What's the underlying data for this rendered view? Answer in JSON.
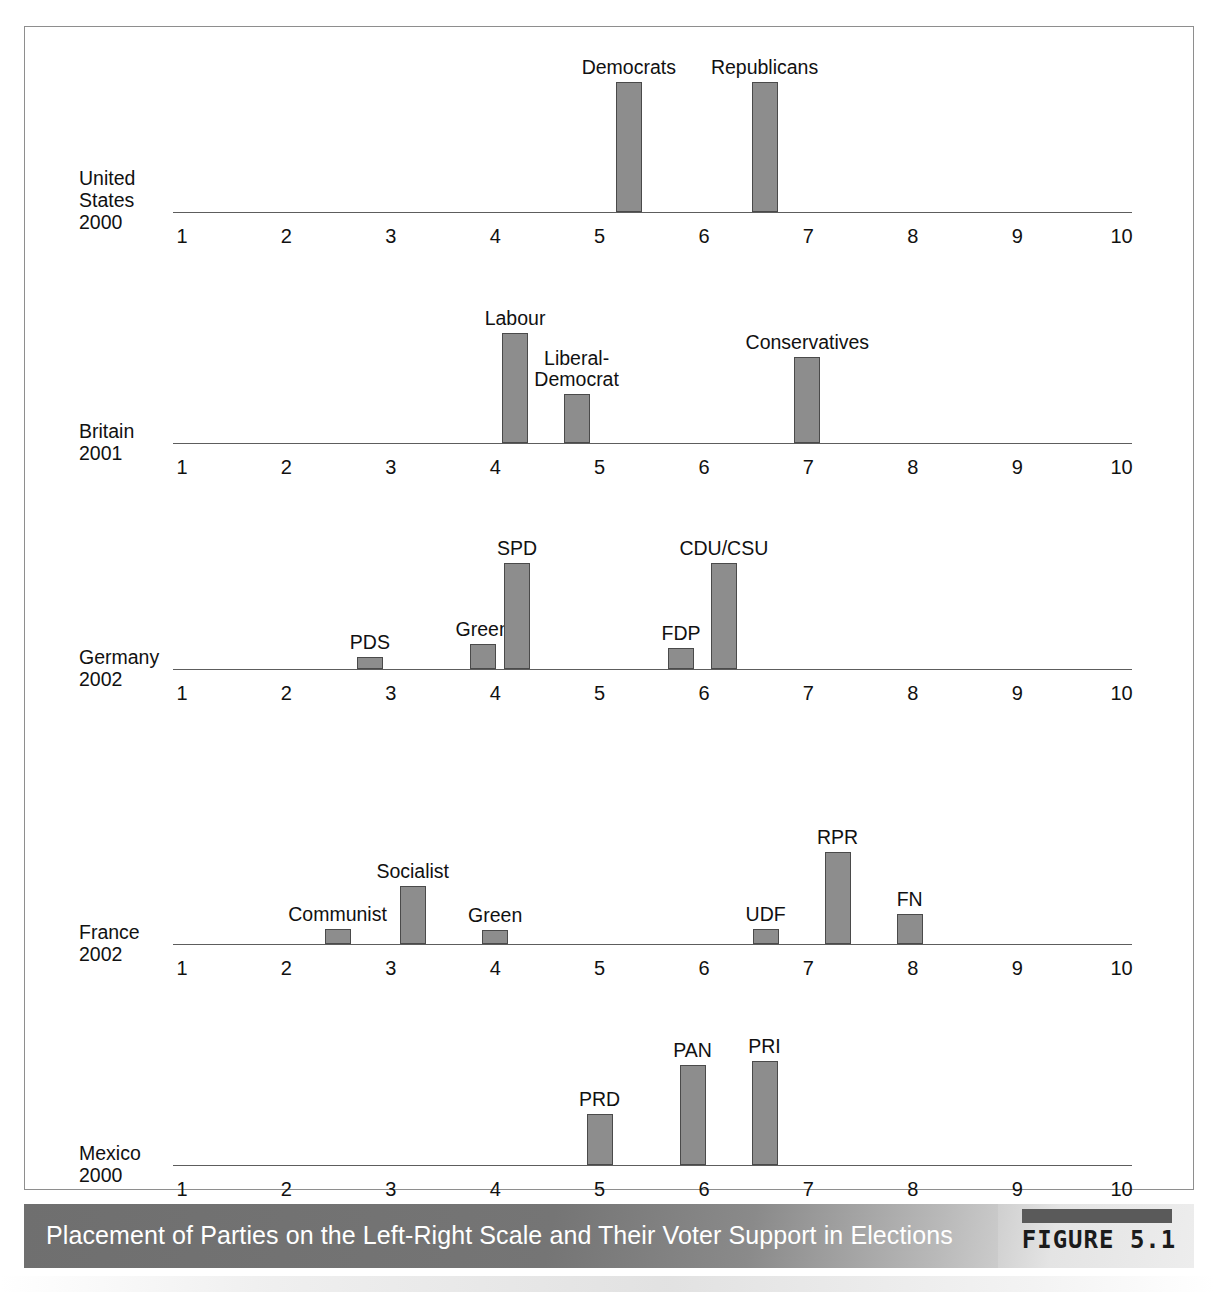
{
  "figure": {
    "caption": "Placement of Parties on the Left-Right Scale and Their Voter Support in Elections",
    "badge_label": "FIGURE 5.1"
  },
  "axis": {
    "ticks": [
      "1",
      "2",
      "3",
      "4",
      "5",
      "6",
      "7",
      "8",
      "9",
      "10"
    ],
    "min": 1,
    "max": 10
  },
  "colors": {
    "bar_fill": "#8d8d8d",
    "bar_stroke": "#4a4a4a",
    "axis": "#5d5d5d",
    "frame": "#8e8e8e",
    "caption_text": "#ffffff"
  },
  "panels": [
    {
      "country": "United States",
      "year": "2000",
      "label_lines": "United\nStates\n2000",
      "bars": [
        {
          "label": "Democrats",
          "x": 5.28,
          "height": 130
        },
        {
          "label": "Republicans",
          "x": 6.58,
          "height": 130
        }
      ]
    },
    {
      "country": "Britain",
      "year": "2001",
      "label_lines": "Britain\n2001",
      "bars": [
        {
          "label": "Labour",
          "x": 4.19,
          "height": 110
        },
        {
          "label": "Liberal-\nDemocrat",
          "x": 4.78,
          "height": 49
        },
        {
          "label": "Conservatives",
          "x": 6.99,
          "height": 86
        }
      ]
    },
    {
      "country": "Germany",
      "year": "2002",
      "label_lines": "Germany\n2002",
      "bars": [
        {
          "label": "PDS",
          "x": 2.8,
          "height": 12
        },
        {
          "label": "Green",
          "x": 3.88,
          "height": 25
        },
        {
          "label": "SPD",
          "x": 4.21,
          "height": 106
        },
        {
          "label": "FDP",
          "x": 5.78,
          "height": 21
        },
        {
          "label": "CDU/CSU",
          "x": 6.19,
          "height": 106
        }
      ]
    },
    {
      "country": "France",
      "year": "2002",
      "label_lines": "France\n2002",
      "bars": [
        {
          "label": "Communist",
          "x": 2.49,
          "height": 15
        },
        {
          "label": "Socialist",
          "x": 3.21,
          "height": 58
        },
        {
          "label": "Green",
          "x": 4.0,
          "height": 14
        },
        {
          "label": "UDF",
          "x": 6.59,
          "height": 15
        },
        {
          "label": "RPR",
          "x": 7.28,
          "height": 92
        },
        {
          "label": "FN",
          "x": 7.97,
          "height": 30
        }
      ]
    },
    {
      "country": "Mexico",
      "year": "2000",
      "label_lines": "Mexico\n2000",
      "bars": [
        {
          "label": "PRD",
          "x": 5.0,
          "height": 51
        },
        {
          "label": "PAN",
          "x": 5.89,
          "height": 100
        },
        {
          "label": "PRI",
          "x": 6.58,
          "height": 104
        }
      ]
    }
  ],
  "chart_data": {
    "type": "bar",
    "title": "Placement of Parties on the Left-Right Scale and Their Voter Support in Elections",
    "xlabel": "Left-Right Scale",
    "ylabel": "Voter Support",
    "xlim": [
      1,
      10
    ],
    "xticks": [
      1,
      2,
      3,
      4,
      5,
      6,
      7,
      8,
      9,
      10
    ],
    "grid": false,
    "legend": "none",
    "note": "Each subplot is one country/election year; bar x-position = left-right placement, bar height = voter support.",
    "subplots": [
      {
        "name": "United States 2000",
        "categories": [
          "Democrats",
          "Republicans"
        ],
        "x": [
          5.28,
          6.58
        ],
        "values": [
          130,
          130
        ]
      },
      {
        "name": "Britain 2001",
        "categories": [
          "Labour",
          "Liberal-Democrat",
          "Conservatives"
        ],
        "x": [
          4.19,
          4.78,
          6.99
        ],
        "values": [
          110,
          49,
          86
        ]
      },
      {
        "name": "Germany 2002",
        "categories": [
          "PDS",
          "Green",
          "SPD",
          "FDP",
          "CDU/CSU"
        ],
        "x": [
          2.8,
          3.88,
          4.21,
          5.78,
          6.19
        ],
        "values": [
          12,
          25,
          106,
          21,
          106
        ]
      },
      {
        "name": "France 2002",
        "categories": [
          "Communist",
          "Socialist",
          "Green",
          "UDF",
          "RPR",
          "FN"
        ],
        "x": [
          2.49,
          3.21,
          4.0,
          6.59,
          7.28,
          7.97
        ],
        "values": [
          15,
          58,
          14,
          15,
          92,
          30
        ]
      },
      {
        "name": "Mexico 2000",
        "categories": [
          "PRD",
          "PAN",
          "PRI"
        ],
        "x": [
          5.0,
          5.89,
          6.58
        ],
        "values": [
          51,
          100,
          104
        ]
      }
    ]
  }
}
